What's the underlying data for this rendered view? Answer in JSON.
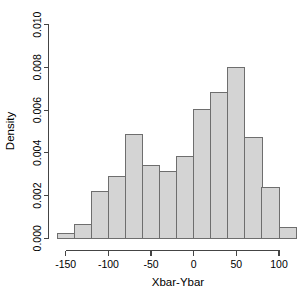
{
  "chart_data": {
    "type": "bar",
    "subtype": "histogram",
    "title": "",
    "xlabel": "Xbar-Ybar",
    "ylabel": "Density",
    "xlim": [
      -165,
      122
    ],
    "ylim": [
      0.0,
      0.01
    ],
    "grid": false,
    "legend": null,
    "bar_fill_color": "#d4d4d4",
    "bar_border_color": "#6e6e6e",
    "axis_color": "#444444",
    "background_color": "#ffffff",
    "bin_width": 20,
    "bin_edges": [
      -160,
      -140,
      -120,
      -100,
      -80,
      -60,
      -40,
      -20,
      0,
      20,
      40,
      60,
      80,
      100,
      120
    ],
    "bin_centers": [
      -150,
      -130,
      -110,
      -90,
      -70,
      -50,
      -30,
      -10,
      10,
      30,
      50,
      70,
      90,
      110
    ],
    "values": [
      0.00025,
      0.00065,
      0.0022,
      0.0029,
      0.00485,
      0.00343,
      0.00312,
      0.00383,
      0.00603,
      0.00683,
      0.008,
      0.00473,
      0.0024,
      0.0005
    ],
    "x_ticks": [
      -150,
      -100,
      -50,
      0,
      50,
      100
    ],
    "x_tick_labels": [
      "-150",
      "-100",
      "-50",
      "0",
      "50",
      "100"
    ],
    "y_ticks": [
      0.0,
      0.002,
      0.004,
      0.006,
      0.008,
      0.01
    ],
    "y_tick_labels": [
      "0.000",
      "0.002",
      "0.004",
      "0.006",
      "0.008",
      "0.010"
    ]
  }
}
